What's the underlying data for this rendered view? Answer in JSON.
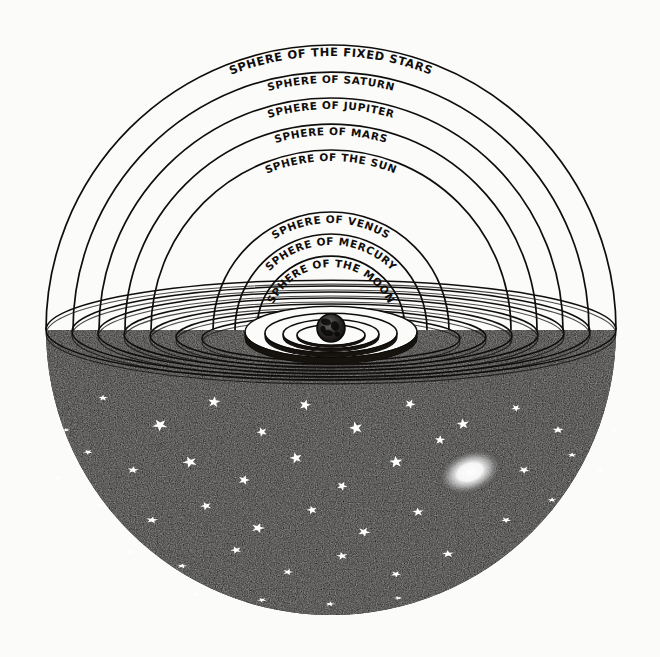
{
  "figure": {
    "background_color": "#fbfbfa",
    "ink_color": "#100e0c",
    "star_color": "#ffffff"
  },
  "spheres": [
    {
      "id": "fixed-stars",
      "label": "SPHERE OF THE FIXED STARS",
      "order": 1,
      "radius_px": 285
    },
    {
      "id": "saturn",
      "label": "SPHERE OF SATURN",
      "order": 2,
      "radius_px": 258
    },
    {
      "id": "jupiter",
      "label": "SPHERE OF JUPITER",
      "order": 3,
      "radius_px": 232
    },
    {
      "id": "mars",
      "label": "SPHERE OF MARS",
      "order": 4,
      "radius_px": 206
    },
    {
      "id": "sun",
      "label": "SPHERE OF THE SUN",
      "order": 5,
      "radius_px": 180
    },
    {
      "id": "venus",
      "label": "SPHERE OF VENUS",
      "order": 6,
      "radius_px": 118
    },
    {
      "id": "mercury",
      "label": "SPHERE OF MERCURY",
      "order": 7,
      "radius_px": 96
    },
    {
      "id": "moon",
      "label": "SPHERE OF THE MOON",
      "order": 8,
      "radius_px": 74
    }
  ],
  "center_body": {
    "name": "Earth",
    "label": "",
    "cx": 331,
    "cy": 328,
    "radius_px": 14
  },
  "horizon": {
    "cx": 331,
    "cy": 330,
    "ring_count": 7,
    "note": "Elliptical rings forming the horizon plane where the celestial arcs meet."
  },
  "nebula": {
    "name": "glowing-nebula",
    "cx": 470,
    "cy": 472,
    "rx": 34,
    "ry": 22,
    "rotation_deg": -20
  },
  "starfield": {
    "star_count": 46,
    "stars": [
      {
        "x": 103,
        "y": 398,
        "r": 5.0
      },
      {
        "x": 160,
        "y": 425,
        "r": 8.0
      },
      {
        "x": 214,
        "y": 402,
        "r": 6.5
      },
      {
        "x": 262,
        "y": 432,
        "r": 5.5
      },
      {
        "x": 305,
        "y": 405,
        "r": 6.0
      },
      {
        "x": 356,
        "y": 428,
        "r": 7.0
      },
      {
        "x": 410,
        "y": 404,
        "r": 5.5
      },
      {
        "x": 463,
        "y": 424,
        "r": 6.5
      },
      {
        "x": 516,
        "y": 408,
        "r": 5.0
      },
      {
        "x": 558,
        "y": 430,
        "r": 6.0
      },
      {
        "x": 88,
        "y": 452,
        "r": 5.0
      },
      {
        "x": 133,
        "y": 470,
        "r": 6.0
      },
      {
        "x": 190,
        "y": 462,
        "r": 7.5
      },
      {
        "x": 244,
        "y": 480,
        "r": 6.0
      },
      {
        "x": 296,
        "y": 458,
        "r": 6.5
      },
      {
        "x": 342,
        "y": 486,
        "r": 5.5
      },
      {
        "x": 396,
        "y": 462,
        "r": 7.0
      },
      {
        "x": 524,
        "y": 470,
        "r": 6.0
      },
      {
        "x": 572,
        "y": 455,
        "r": 5.0
      },
      {
        "x": 100,
        "y": 505,
        "r": 5.5
      },
      {
        "x": 152,
        "y": 520,
        "r": 6.5
      },
      {
        "x": 206,
        "y": 506,
        "r": 6.0
      },
      {
        "x": 258,
        "y": 528,
        "r": 7.0
      },
      {
        "x": 312,
        "y": 510,
        "r": 5.5
      },
      {
        "x": 364,
        "y": 532,
        "r": 6.5
      },
      {
        "x": 418,
        "y": 512,
        "r": 6.0
      },
      {
        "x": 506,
        "y": 520,
        "r": 5.5
      },
      {
        "x": 552,
        "y": 500,
        "r": 5.0
      },
      {
        "x": 130,
        "y": 552,
        "r": 5.0
      },
      {
        "x": 182,
        "y": 566,
        "r": 5.5
      },
      {
        "x": 236,
        "y": 550,
        "r": 6.0
      },
      {
        "x": 288,
        "y": 572,
        "r": 5.5
      },
      {
        "x": 342,
        "y": 556,
        "r": 6.0
      },
      {
        "x": 396,
        "y": 574,
        "r": 5.5
      },
      {
        "x": 448,
        "y": 554,
        "r": 6.5
      },
      {
        "x": 498,
        "y": 566,
        "r": 5.0
      },
      {
        "x": 196,
        "y": 594,
        "r": 4.5
      },
      {
        "x": 262,
        "y": 600,
        "r": 5.0
      },
      {
        "x": 330,
        "y": 604,
        "r": 5.0
      },
      {
        "x": 398,
        "y": 598,
        "r": 4.5
      },
      {
        "x": 462,
        "y": 588,
        "r": 4.5
      },
      {
        "x": 66,
        "y": 430,
        "r": 4.0
      },
      {
        "x": 600,
        "y": 470,
        "r": 4.5
      },
      {
        "x": 614,
        "y": 430,
        "r": 4.0
      },
      {
        "x": 58,
        "y": 478,
        "r": 4.0
      },
      {
        "x": 440,
        "y": 440,
        "r": 5.5
      }
    ]
  }
}
